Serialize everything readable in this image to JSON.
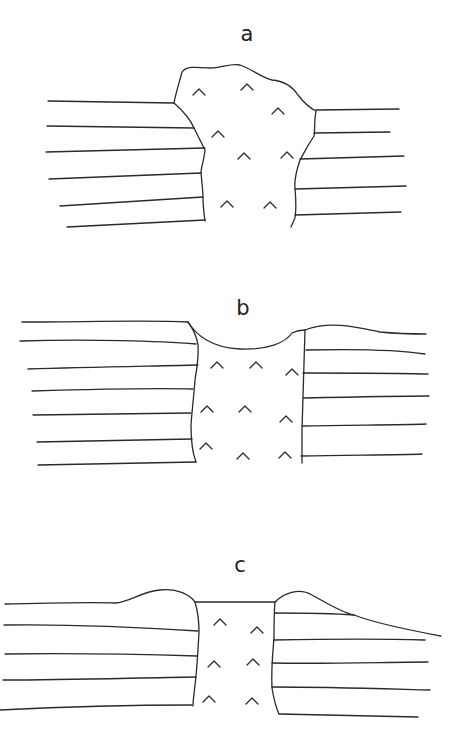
{
  "figure": {
    "panels": [
      {
        "id": "a",
        "label": "a",
        "description": "Intrusion protruding above the strata surface"
      },
      {
        "id": "b",
        "label": "b",
        "description": "Intrusion surface depressed below the strata surface"
      },
      {
        "id": "c",
        "label": "c",
        "description": "Intrusion top level with the surface, flanked by raised mounds"
      }
    ],
    "symbols": {
      "intrusion_fill": "^",
      "line_color": "#2a2a2a",
      "background": "#ffffff"
    }
  }
}
